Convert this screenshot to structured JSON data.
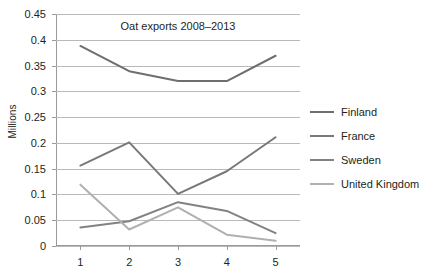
{
  "chart_data": {
    "type": "line",
    "title": "Oat exports 2008–2013",
    "xlabel": "",
    "ylabel": "Millions",
    "x": [
      1,
      2,
      3,
      4,
      5
    ],
    "xtick_labels": [
      "1",
      "2",
      "3",
      "4",
      "5"
    ],
    "ytick_labels": [
      "0.45",
      "0.4",
      "0.35",
      "0.3",
      "0.25",
      "0.2",
      "0.15",
      "0.1",
      "0.05",
      "0"
    ],
    "ytick_values": [
      0.45,
      0.4,
      0.35,
      0.3,
      0.25,
      0.2,
      0.15,
      0.1,
      0.05,
      0
    ],
    "ylim": [
      0,
      0.45
    ],
    "xlim": [
      0.5,
      5.5
    ],
    "grid": "horizontal",
    "legend_position": "right",
    "series": [
      {
        "name": "Finland",
        "color": "#6e6e6e",
        "values": [
          0.388,
          0.339,
          0.32,
          0.32,
          0.369
        ]
      },
      {
        "name": "France",
        "color": "#787878",
        "values": [
          0.156,
          0.201,
          0.101,
          0.145,
          0.211
        ]
      },
      {
        "name": "Sweden",
        "color": "#828282",
        "values": [
          0.036,
          0.048,
          0.085,
          0.068,
          0.025
        ]
      },
      {
        "name": "United Kingdom",
        "color": "#b0b0b0",
        "values": [
          0.119,
          0.032,
          0.075,
          0.022,
          0.01
        ]
      }
    ]
  }
}
